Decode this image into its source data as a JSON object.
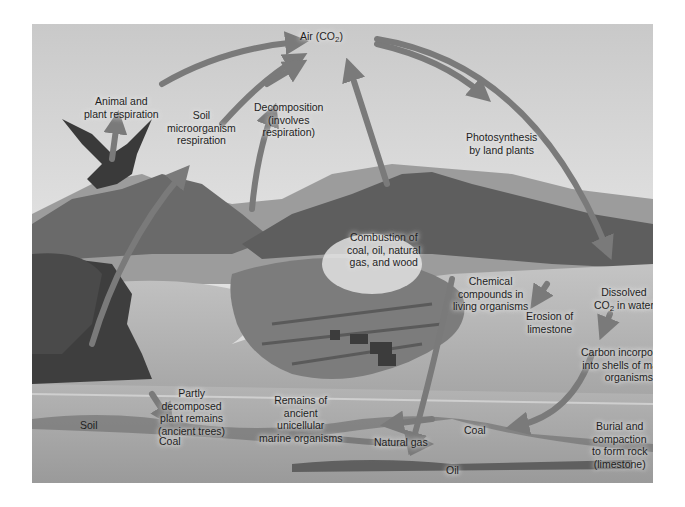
{
  "diagram": {
    "colors": {
      "sky": "#d4d4d4",
      "mountains": "#6e6e6e",
      "water": "#b8b8b8",
      "forest": "#4a4a4a",
      "arrows": "#7a7a7a",
      "sediment": "#a8a8a8",
      "text": "#1e1e1e"
    },
    "labels": {
      "air_co2": {
        "main": "Air (CO",
        "sub": "2",
        "tail": ")"
      },
      "animal_plant_respiration": [
        "Animal and",
        "plant respiration"
      ],
      "soil_microorganism_respiration": [
        "Soil",
        "microorganism",
        "respiration"
      ],
      "decomposition": [
        "Decomposition",
        "(involves",
        "respiration)"
      ],
      "photosynthesis": [
        "Photosynthesis",
        "by land plants"
      ],
      "combustion": [
        "Combustion of",
        "coal, oil, natural",
        "gas, and wood"
      ],
      "chemical_compounds": [
        "Chemical",
        "compounds in",
        "living organisms"
      ],
      "erosion": [
        "Erosion of",
        "limestone"
      ],
      "dissolved_co2": {
        "line1": "Dissolved",
        "main": "CO",
        "sub": "2",
        "tail": " in water"
      },
      "carbon_shells": [
        "Carbon incorporated",
        "into shells of marine",
        "organisms"
      ],
      "soil": "Soil",
      "partly_decomposed": [
        "Partly",
        "decomposed",
        "plant remains",
        "(ancient trees)"
      ],
      "remains_ancient": [
        "Remains of",
        "ancient",
        "unicellular",
        "marine organisms"
      ],
      "coal_left": "Coal",
      "natural_gas": "Natural gas",
      "coal_right": "Coal",
      "oil": "Oil",
      "burial": [
        "Burial and",
        "compaction",
        "to form rock",
        "(limestone)"
      ]
    }
  }
}
